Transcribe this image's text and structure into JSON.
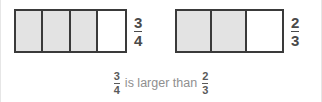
{
  "canvas": {
    "width": 322,
    "height": 102,
    "background": "#ffffff"
  },
  "theme": {
    "bar_border": "#3a3a3a",
    "cell_filled": "#e3e3e3",
    "cell_empty": "#ffffff",
    "label_color": "#4a4a4a",
    "caption_text_color": "#8f8f8f",
    "caption_fraction_color": "#5a5a5a",
    "edge_rule_color": "#e6e6e6"
  },
  "models": [
    {
      "id": "left",
      "numerator": "3",
      "denominator": "4",
      "total_parts": 4,
      "shaded_parts": 3,
      "label": "3/4"
    },
    {
      "id": "right",
      "numerator": "2",
      "denominator": "3",
      "total_parts": 3,
      "shaded_parts": 2,
      "label": "2/3"
    }
  ],
  "caption": {
    "left_numerator": "3",
    "left_denominator": "4",
    "phrase": "is larger than",
    "right_numerator": "2",
    "right_denominator": "3",
    "full_text": "3/4 is larger than 2/3"
  }
}
